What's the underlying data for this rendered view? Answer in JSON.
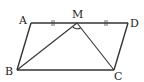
{
  "diagram": {
    "type": "geometry",
    "shape": "parallelogram with triangle",
    "points": {
      "A": {
        "label": "A",
        "x": 31,
        "y": 23
      },
      "M": {
        "label": "M",
        "x": 77,
        "y": 23
      },
      "D": {
        "label": "D",
        "x": 128,
        "y": 23
      },
      "B": {
        "label": "B",
        "x": 17,
        "y": 70
      },
      "C": {
        "label": "C",
        "x": 114,
        "y": 70
      }
    },
    "segments": [
      "AD",
      "BC",
      "AB",
      "DC",
      "MB",
      "MC"
    ],
    "equal_marks": [
      "AM",
      "MD"
    ],
    "angle_mark": "BMC",
    "colors": {
      "stroke": "#333333",
      "text": "#222222",
      "background": "#ffffff"
    }
  }
}
